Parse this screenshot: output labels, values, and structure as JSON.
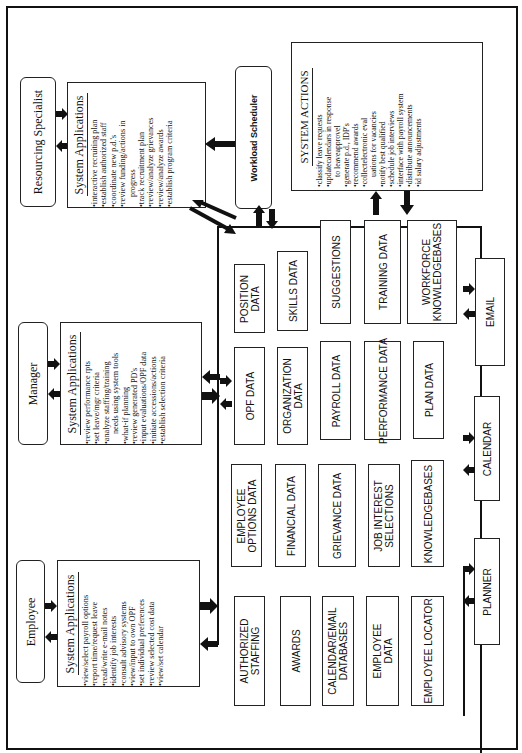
{
  "actors": {
    "resourcing_specialist": "Resourcing Specialist",
    "manager": "Manager",
    "employee": "Employee",
    "workload_scheduler": "Workload Scheduler"
  },
  "system_applications": {
    "resourcing_specialist": {
      "title": "System Applications",
      "items": [
        "•interactive recruiting plan",
        "•establish authorized staff",
        "•coordinate new p.d.'s",
        "•review funding/actions in",
        "progress",
        "•track recruitment plan",
        "•review/analyze grievances",
        "•review/analyze awards",
        "•establish program criteria"
      ]
    },
    "manager": {
      "title": "System Applications",
      "items": [
        "•review performance rpts",
        "•set leave/mgr criteria",
        "•analyze staffing/training",
        "needs using system tools",
        "•what-if planning",
        "•review generated PD's",
        "•input evaluations/OPF data",
        "•initiate accessions/actions",
        "•establish selection criteria"
      ]
    },
    "employee": {
      "title": "System Applications",
      "items": [
        "•view/select payroll options",
        "•report time/request leave",
        "•read/write e-mail notes",
        "•identify job interests",
        "•consult advisory systems",
        "•view/input to own OPF",
        "•set individual preferences",
        "•review selected cost data",
        "•view/set calendar"
      ]
    }
  },
  "system_actions": {
    "title": "SYSTEM ACTIONS",
    "items": [
      "•classify leave requests",
      "•updatecalendars in response",
      "to leaveapprovel",
      "•generate p.d., IDP's",
      "•recommend awards",
      "•collectelectronic eval",
      "uations for vacancies",
      "•notify best qualified",
      "•schedule job interviews",
      "•interface with payroll system",
      "•distribute announcements",
      "•id salary adjustments"
    ]
  },
  "databases": {
    "col1": [
      "POSITION\nDATA",
      "SKILLS DATA",
      "SUGGESTIONS",
      "TRAINING DATA",
      "WORKFORCE\nKNOWLEDGEBASES"
    ],
    "col2": [
      "OPF DATA",
      "ORGANIZATION\nDATA",
      "PAYROLL DATA",
      "PERFORMANCE DATA",
      "PLAN DATA"
    ],
    "col3": [
      "EMPLOYEE\nOPTIONS DATA",
      "FINANCIAL DATA",
      "GRIEVANCE DATA",
      "JOB INTEREST\nSELECTIONS",
      "KNOWLEDGEBASES"
    ],
    "col4": [
      "AUTHORIZED\nSTAFFING",
      "AWARDS",
      "CALENDAR/EMAIL\nDATABASES",
      "EMPLOYEE\nDATA",
      "EMPLOYEE LOCATOR"
    ]
  },
  "tools": {
    "email": "EMAIL",
    "calendar": "CALENDAR",
    "planner": "PLANNER"
  },
  "colors": {
    "line": "#111111",
    "background": "#ffffff"
  }
}
